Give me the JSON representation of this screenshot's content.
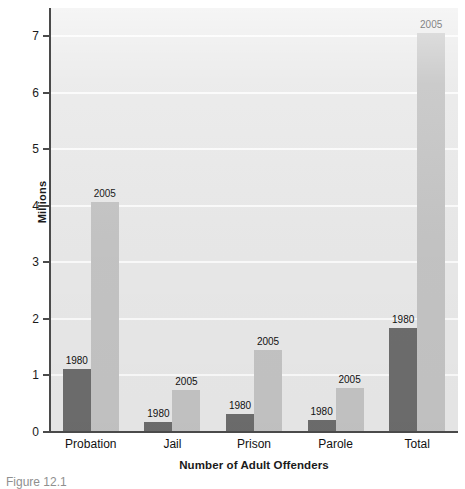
{
  "chart_data": {
    "type": "bar",
    "title": "",
    "subtitle": "",
    "xlabel": "Number of Adult Offenders",
    "ylabel": "Millions",
    "categories": [
      "Probation",
      "Jail",
      "Prison",
      "Parole",
      "Total"
    ],
    "series": [
      {
        "name": "1980",
        "values": [
          1.12,
          0.18,
          0.32,
          0.22,
          1.84
        ]
      },
      {
        "name": "2005",
        "values": [
          4.07,
          0.75,
          1.45,
          0.78,
          7.05
        ]
      }
    ],
    "point_labels": [
      [
        "1980",
        "1980",
        "1980",
        "1980",
        "1980"
      ],
      [
        "2005",
        "2005",
        "2005",
        "2005",
        "2005"
      ]
    ],
    "ylim": [
      0,
      7.5
    ],
    "yticks": [
      0,
      1,
      2,
      3,
      4,
      5,
      6,
      7
    ],
    "ytick_labels": [
      "0",
      "1",
      "2",
      "3",
      "4",
      "5",
      "6",
      "7"
    ],
    "grid": "horizontal",
    "legend": "none",
    "legend_position": "none",
    "colors": {
      "series_1980": "#6d6d6d",
      "series_2005": "#c4c4c4",
      "plot_background": "#e9e9e9",
      "gridline": "#fbfbfb",
      "axis": "#4a4a4a",
      "text": "#111111"
    }
  },
  "caption": {
    "text": "Figure 12.1"
  }
}
